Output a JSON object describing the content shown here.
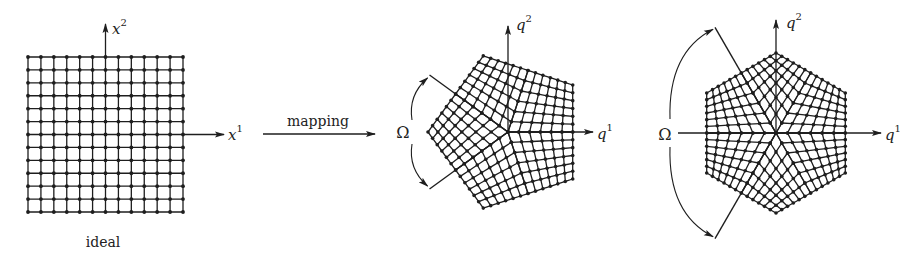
{
  "colors": {
    "ink": "#1e1e1e",
    "background": "#ffffff"
  },
  "labels": {
    "ideal": "ideal",
    "mapping": "mapping",
    "x1": "x",
    "x1_sup": "1",
    "x2": "x",
    "x2_sup": "2",
    "p_q1": "q",
    "p_q1_sup": "1",
    "p_q2": "q",
    "p_q2_sup": "2",
    "h_q1": "q",
    "h_q1_sup": "1",
    "h_q2": "q",
    "h_q2_sup": "2",
    "omega_p": "Ω",
    "omega_h": "Ω"
  },
  "square_grid": {
    "x0": 28,
    "y0": 57,
    "size": 155,
    "cells": 12,
    "axis_center": [
      105.5,
      134.5
    ],
    "x_axis_end": 224,
    "y_axis_top": 24
  },
  "mapping_arrow": {
    "x1": 263,
    "x2": 375,
    "y": 134
  },
  "pentagon": {
    "center": [
      508,
      132
    ],
    "radius": 80,
    "sides": 5,
    "cells": 6,
    "vertex_angles": [
      180,
      108,
      36,
      -36,
      -108
    ],
    "q1_end": 593,
    "q2_top": 26,
    "omega_rays": [
      144,
      216
    ],
    "omega_ray_length": 97,
    "omega_arc_x": 410
  },
  "hexagon": {
    "center": [
      776,
      133
    ],
    "radius": 80,
    "sides": 6,
    "cells": 6,
    "vertex_angles": [
      90,
      30,
      -30,
      -90,
      -150,
      150
    ],
    "q1_start": 678,
    "q1_end": 881,
    "q2_top": 20,
    "omega_rays": [
      120,
      240
    ],
    "omega_ray_length": 122,
    "omega_arc_x": 668
  }
}
